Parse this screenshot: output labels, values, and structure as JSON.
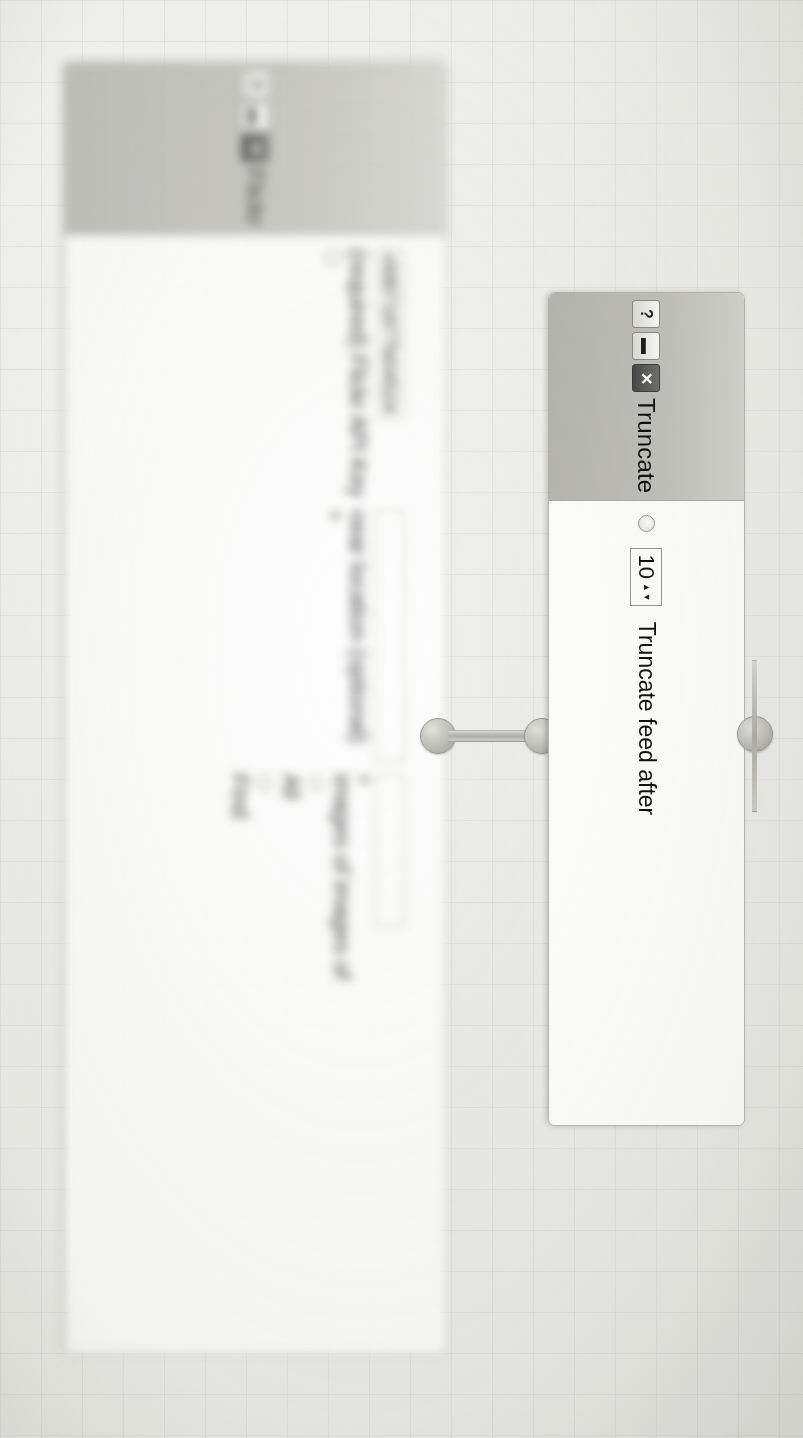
{
  "app": {
    "canvas_name": "pipes-editor-canvas",
    "background_grid": true,
    "accent_color": "#b7b7b1",
    "window_bg": "#ffffff",
    "titlebar_color": "#c3c3bd"
  },
  "modules": [
    {
      "id": "flickr",
      "title": "Flickr",
      "focus": "blurred",
      "window_buttons": [
        {
          "name": "help-button",
          "glyph": "?"
        },
        {
          "name": "minimize-button",
          "glyph": "▬"
        },
        {
          "name": "close-button",
          "glyph": "✕"
        }
      ],
      "rows": [
        {
          "label": "Find  ",
          "radio_1_label": "All",
          "radio_2_label": "Any",
          "suffix": " images of images of",
          "text_value": ""
        },
        {
          "label": "near location (optional)",
          "text_value": ""
        },
        {
          "label": "(required) Flickr API Key",
          "text_value": "cfd871877b04524"
        }
      ]
    },
    {
      "id": "truncate",
      "title": "Truncate",
      "focus": "sharp",
      "window_buttons": [
        {
          "name": "help-button",
          "glyph": "?"
        },
        {
          "name": "minimize-button",
          "glyph": "▬"
        },
        {
          "name": "close-button",
          "glyph": "✕"
        }
      ],
      "rows": [
        {
          "label": "Truncate feed after",
          "spinner_value": "10",
          "spinner_up": "▲",
          "spinner_down": "▼"
        }
      ]
    }
  ],
  "connections": [
    {
      "name": "flickr-output-node"
    },
    {
      "name": "truncate-input-node"
    },
    {
      "name": "truncate-output-node"
    }
  ]
}
